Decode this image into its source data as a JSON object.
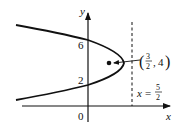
{
  "figure": {
    "axes": {
      "x_label": "x",
      "y_label": "y",
      "origin_label": "0"
    },
    "y_ticks": [
      {
        "label": "6",
        "value": 6
      },
      {
        "label": "2",
        "value": 2
      }
    ],
    "curve": {
      "type": "parabola",
      "opens": "left",
      "y_intercepts": [
        2,
        6
      ]
    },
    "point": {
      "label_num": "3",
      "label_den": "2",
      "label_y": "4",
      "x": 1.5,
      "y": 4
    },
    "directrix": {
      "label_prefix": "x =",
      "num": "5",
      "den": "2",
      "x": 2.5
    },
    "colors": {
      "ink": "#111111",
      "background": "#ffffff"
    }
  }
}
